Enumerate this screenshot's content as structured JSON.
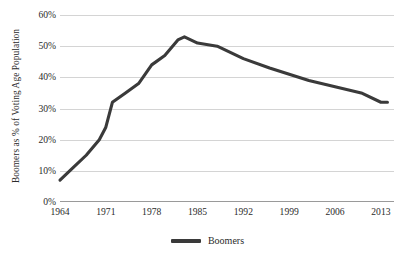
{
  "chart_data": {
    "type": "line",
    "title": "",
    "xlabel": "",
    "ylabel": "Boomers as % of Voting Age Population",
    "xlim": [
      1964,
      2015
    ],
    "ylim": [
      0,
      60
    ],
    "y_tick_suffix": "%",
    "y_ticks": [
      60,
      50,
      40,
      30,
      20,
      10,
      0
    ],
    "y_tick_labels": [
      "60%",
      "50%",
      "40%",
      "30%",
      "20%",
      "10%",
      "0%"
    ],
    "x_ticks": [
      1964,
      1971,
      1978,
      1985,
      1992,
      1999,
      2006,
      2013
    ],
    "x_tick_labels": [
      "1964",
      "1971",
      "1978",
      "1985",
      "1992",
      "1999",
      "2006",
      "2013"
    ],
    "grid": true,
    "legend_position": "bottom",
    "series": [
      {
        "name": "Boomers",
        "color": "#3a3a3a",
        "x": [
          1964,
          1966,
          1968,
          1970,
          1971,
          1972,
          1974,
          1976,
          1978,
          1980,
          1982,
          1983,
          1985,
          1988,
          1992,
          1996,
          1999,
          2002,
          2006,
          2010,
          2013,
          2014
        ],
        "values": [
          7,
          11,
          15,
          20,
          24,
          32,
          35,
          38,
          44,
          47,
          52,
          53,
          51,
          50,
          46,
          43,
          41,
          39,
          37,
          35,
          32,
          32
        ]
      }
    ]
  },
  "legend": {
    "label": "Boomers",
    "swatch": "line-swatch"
  },
  "axes": {
    "y_title": "Boomers as % of Voting Age Population"
  }
}
